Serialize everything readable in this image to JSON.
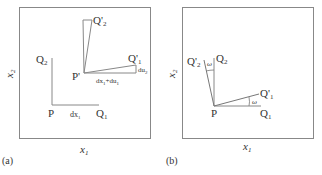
{
  "panels": [
    {
      "id": "a",
      "caption": "(a)",
      "xlabel": "x",
      "xlabel_sub": "1",
      "ylabel": "x",
      "ylabel_sub": "2",
      "points": {
        "P": "P",
        "Q1": "Q",
        "Q1_sub": "1",
        "Q2": "Q",
        "Q2_sub": "2",
        "Pprime": "P'",
        "Q1prime": "Q'",
        "Q1prime_sub": "1",
        "Q2prime": "Q'",
        "Q2prime_sub": "2"
      },
      "segments": {
        "dx1": "dx",
        "dx1_sub": "1",
        "dx1_du1": "dx",
        "dx1_du1_sub": "1",
        "dx1_du1_plus": "+du",
        "dx1_du1_sub2": "1",
        "du2": "du",
        "du2_sub": "2"
      }
    },
    {
      "id": "b",
      "caption": "(b)",
      "xlabel": "x",
      "xlabel_sub": "1",
      "ylabel": "x",
      "ylabel_sub": "2",
      "points": {
        "P": "P",
        "Q1": "Q",
        "Q1_sub": "1",
        "Q2": "Q",
        "Q2_sub": "2",
        "Q1prime": "Q'",
        "Q1prime_sub": "1",
        "Q2prime": "Q'",
        "Q2prime_sub": "2"
      },
      "angles": {
        "omega_top": "ω",
        "omega_right": "ω"
      }
    }
  ],
  "colors": {
    "stroke": "#777777",
    "text": "#333333"
  }
}
